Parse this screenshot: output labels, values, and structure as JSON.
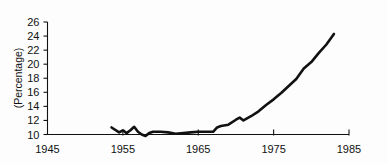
{
  "chart_data": {
    "type": "line",
    "title": "",
    "subtitle": "",
    "xlabel": "",
    "ylabel": "(Percentage)",
    "xlim": [
      1945,
      1985
    ],
    "ylim": [
      10,
      26
    ],
    "grid": false,
    "legend": null,
    "x_ticks": [
      "1945",
      "1955",
      "1965",
      "1975",
      "1985"
    ],
    "x_tick_values": [
      1945,
      1955,
      1965,
      1975,
      1985
    ],
    "y_ticks": [
      "10",
      "12",
      "14",
      "16",
      "18",
      "20",
      "22",
      "24",
      "26"
    ],
    "y_tick_values": [
      10,
      12,
      14,
      16,
      18,
      20,
      22,
      24,
      26
    ],
    "series": [
      {
        "name": "Percentage",
        "color": "#111111",
        "x": [
          1953.5,
          1954.5,
          1955.0,
          1955.5,
          1956.0,
          1956.5,
          1957.0,
          1957.5,
          1958.0,
          1958.5,
          1959.0,
          1960.0,
          1961.0,
          1962.0,
          1963.0,
          1964.0,
          1965.0,
          1966.0,
          1967.0,
          1967.5,
          1968.0,
          1969.0,
          1970.0,
          1970.5,
          1971.0,
          1972.0,
          1973.0,
          1974.0,
          1975.0,
          1976.0,
          1977.0,
          1978.0,
          1979.0,
          1980.0,
          1981.0,
          1982.0,
          1983.0
        ],
        "y": [
          11.0,
          10.3,
          10.6,
          10.2,
          10.6,
          11.1,
          10.4,
          10.0,
          9.8,
          10.2,
          10.4,
          10.4,
          10.3,
          10.1,
          10.2,
          10.3,
          10.4,
          10.4,
          10.4,
          11.0,
          11.2,
          11.4,
          12.1,
          12.4,
          12.0,
          12.6,
          13.3,
          14.2,
          15.0,
          15.9,
          16.9,
          17.9,
          19.4,
          20.3,
          21.6,
          22.8,
          24.3
        ]
      }
    ]
  },
  "axes": {
    "y_axis_title": "(Percentage)"
  }
}
